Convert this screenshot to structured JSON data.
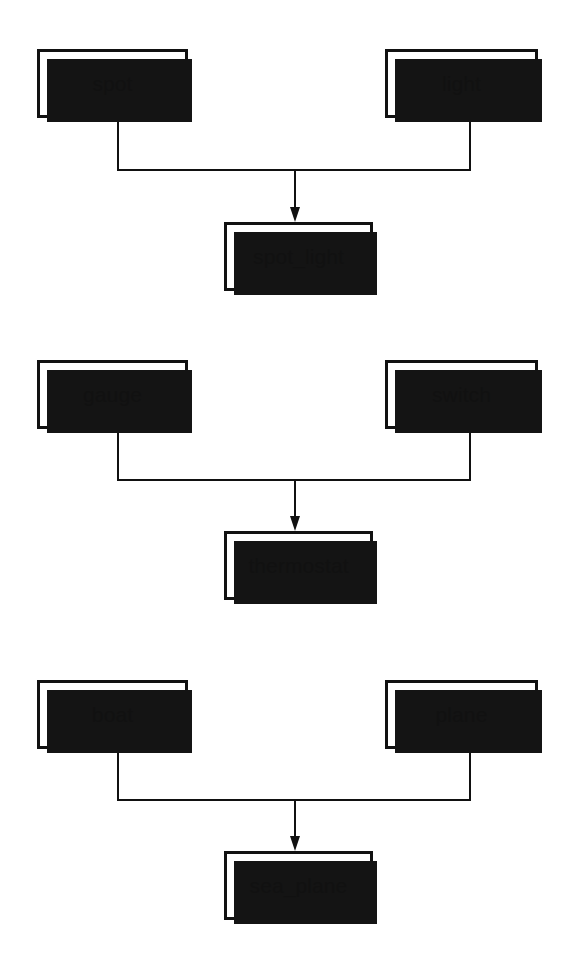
{
  "page": {
    "background_color": "#ffffff",
    "ink_color": "#111111",
    "shadow_color": "#141414"
  },
  "style": {
    "box_fill": "#ffffff",
    "box_border_color": "#111111",
    "box_border_width_px": 3,
    "shadow_offset_px": 7,
    "connector_color": "#111111",
    "connector_width_px": 2,
    "label_font_size_px": 21
  },
  "groups": [
    {
      "id": "group-spot-light",
      "parents": [
        {
          "label": "spot"
        },
        {
          "label": "light"
        }
      ],
      "child": {
        "label": "spot_light"
      },
      "connector": {
        "left_x": 118,
        "right_x": 470,
        "center_x": 295,
        "parent_bottom_y": 118,
        "bar_y": 170,
        "arrow_tip_y": 222
      }
    },
    {
      "id": "group-gauge-switch",
      "parents": [
        {
          "label": "gauge"
        },
        {
          "label": "switch"
        }
      ],
      "child": {
        "label": "thermostat"
      },
      "connector": {
        "left_x": 118,
        "right_x": 470,
        "center_x": 295,
        "parent_bottom_y": 429,
        "bar_y": 480,
        "arrow_tip_y": 531
      }
    },
    {
      "id": "group-boat-plane",
      "parents": [
        {
          "label": "boat"
        },
        {
          "label": "plane"
        }
      ],
      "child": {
        "label": "sea_plane"
      },
      "connector": {
        "left_x": 118,
        "right_x": 470,
        "center_x": 295,
        "parent_bottom_y": 749,
        "bar_y": 800,
        "arrow_tip_y": 851
      }
    }
  ]
}
